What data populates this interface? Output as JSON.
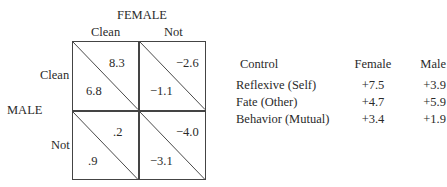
{
  "matrix": {
    "column_axis_label": "FEMALE",
    "row_axis_label": "MALE",
    "column_labels": [
      "Clean",
      "Not"
    ],
    "row_labels": [
      "Clean",
      "Not"
    ],
    "cells": [
      [
        {
          "upper_right": "8.3",
          "lower_left": "6.8"
        },
        {
          "upper_right": "−2.6",
          "lower_left": "−1.1"
        }
      ],
      [
        {
          "upper_right": ".2",
          "lower_left": ".9"
        },
        {
          "upper_right": "−4.0",
          "lower_left": "−3.1"
        }
      ]
    ]
  },
  "table": {
    "headers": [
      "Control",
      "Female",
      "Male"
    ],
    "rows": [
      [
        "Reflexive (Self)",
        "+7.5",
        "+3.9"
      ],
      [
        "Fate (Other)",
        "+4.7",
        "+5.9"
      ],
      [
        "Behavior (Mutual)",
        "+3.4",
        "+1.9"
      ]
    ]
  }
}
